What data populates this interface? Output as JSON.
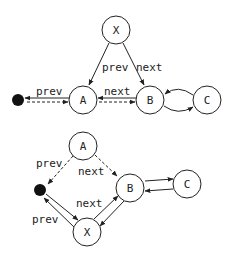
{
  "diagram": {
    "top": {
      "nodes": {
        "x": "X",
        "a": "A",
        "b": "B",
        "c": "C"
      },
      "edges": {
        "x_to_a": "prev",
        "x_to_b": "next",
        "a_to_null": "prev",
        "a_b": "next"
      }
    },
    "bottom": {
      "nodes": {
        "a": "A",
        "b": "B",
        "c": "C",
        "x": "X"
      },
      "edges": {
        "a_to_null": "prev",
        "a_to_b": "next",
        "x_b": "next",
        "x_null": "prev"
      }
    }
  }
}
